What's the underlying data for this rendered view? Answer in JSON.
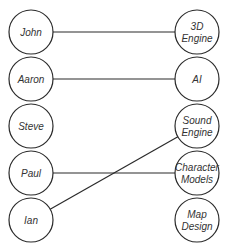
{
  "diagram": {
    "type": "bipartite-matching",
    "colors": {
      "stroke": "#2a2a2a",
      "fill": "#ffffff",
      "text": "#333333"
    },
    "left_nodes": [
      {
        "id": "john",
        "label": [
          "John"
        ],
        "cx": 31,
        "cy": 32
      },
      {
        "id": "aaron",
        "label": [
          "Aaron"
        ],
        "cx": 31,
        "cy": 79
      },
      {
        "id": "steve",
        "label": [
          "Steve"
        ],
        "cx": 31,
        "cy": 126
      },
      {
        "id": "paul",
        "label": [
          "Paul"
        ],
        "cx": 31,
        "cy": 173
      },
      {
        "id": "ian",
        "label": [
          "Ian"
        ],
        "cx": 31,
        "cy": 220
      }
    ],
    "right_nodes": [
      {
        "id": "3d-engine",
        "label": [
          "3D",
          "Engine"
        ],
        "cx": 197,
        "cy": 32
      },
      {
        "id": "ai",
        "label": [
          "AI"
        ],
        "cx": 197,
        "cy": 79
      },
      {
        "id": "sound-engine",
        "label": [
          "Sound",
          "Engine"
        ],
        "cx": 197,
        "cy": 126
      },
      {
        "id": "character-models",
        "label": [
          "Character",
          "Models"
        ],
        "cx": 197,
        "cy": 173
      },
      {
        "id": "map-design",
        "label": [
          "Map",
          "Design"
        ],
        "cx": 197,
        "cy": 220
      }
    ],
    "radius": 22,
    "edges": [
      {
        "from": "john",
        "to": "3d-engine"
      },
      {
        "from": "aaron",
        "to": "ai"
      },
      {
        "from": "paul",
        "to": "character-models"
      },
      {
        "from": "ian",
        "to": "sound-engine"
      }
    ]
  }
}
